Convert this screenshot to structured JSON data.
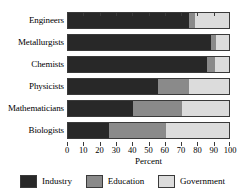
{
  "chart_data": {
    "type": "bar",
    "orientation": "horizontal",
    "stacked": true,
    "stack_mode": "percent",
    "title": "",
    "xlabel": "Percent",
    "ylabel": "",
    "xlim": [
      0,
      100
    ],
    "xticks": [
      0,
      10,
      20,
      30,
      40,
      50,
      60,
      70,
      80,
      90,
      100
    ],
    "xticklabels": [
      "0",
      "10",
      "20",
      "30",
      "40",
      "50",
      "60",
      "70",
      "80",
      "90",
      "100"
    ],
    "grid": false,
    "legend_position": "bottom",
    "categories": [
      "Engineers",
      "Metallurgists",
      "Chemists",
      "Physicists",
      "Mathematicians",
      "Biologists"
    ],
    "series": [
      {
        "name": "Industry",
        "color": "#282828",
        "values": [
          74,
          88,
          85,
          55,
          40,
          25
        ]
      },
      {
        "name": "Education",
        "color": "#8a8a8a",
        "values": [
          4,
          3,
          5,
          19,
          30,
          35
        ]
      },
      {
        "name": "Government",
        "color": "#dcdcdc",
        "values": [
          22,
          9,
          10,
          26,
          30,
          40
        ]
      }
    ]
  },
  "legend": {
    "entries": [
      {
        "label": "Industry",
        "color": "#282828"
      },
      {
        "label": "Education",
        "color": "#8a8a8a"
      },
      {
        "label": "Government",
        "color": "#dcdcdc"
      }
    ]
  }
}
